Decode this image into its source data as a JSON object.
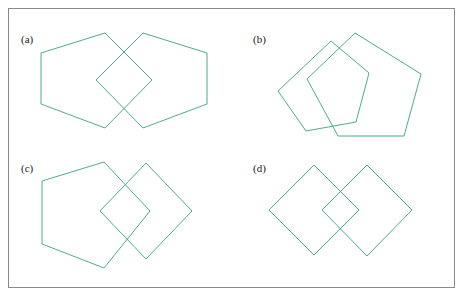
{
  "figure": {
    "width": 465,
    "height": 298,
    "background_color": "#ffffff",
    "frame": {
      "color": "#8a8a8a",
      "x": 8,
      "y": 8,
      "width": 447,
      "height": 280,
      "stroke_width": 1
    },
    "stroke_color": "#3aa37f",
    "stroke_width": 0.9,
    "label_color": "#1a1a1a"
  },
  "panels": [
    {
      "id": "a",
      "label": "(a)",
      "label_x": 21,
      "label_y": 43,
      "description": "Two mirrored pentagons overlapping at their points, forming a central diamond",
      "shapes": [
        {
          "name": "left-pentagon",
          "points": "105,33 41,53 41,104 105,128 152,80"
        },
        {
          "name": "right-pentagon",
          "points": "143,33 207,53 207,104 143,128 96,80"
        }
      ]
    },
    {
      "id": "b",
      "label": "(b)",
      "label_x": 253,
      "label_y": 43,
      "description": "Two rotated pentagons overlapping, one tilted clockwise",
      "shapes": [
        {
          "name": "left-pentagon-rotated",
          "points": "331,41 369,73 356,122 306,131 278,91"
        },
        {
          "name": "right-pentagon",
          "points": "355,33 421,74 404,136 338,136 307,79"
        }
      ]
    },
    {
      "id": "c",
      "label": "(c)",
      "label_x": 21,
      "label_y": 172,
      "description": "A pentagon on the left overlapping a square rotated 45 degrees on the right",
      "shapes": [
        {
          "name": "pentagon",
          "points": "104,162 42,181 42,244 104,268 150,211"
        },
        {
          "name": "diamond-square",
          "points": "146,163 192,211 146,259 100,211"
        }
      ]
    },
    {
      "id": "d",
      "label": "(d)",
      "label_x": 253,
      "label_y": 172,
      "description": "Two squares rotated 45 degrees overlapping side by side",
      "shapes": [
        {
          "name": "left-diamond",
          "points": "314,165 359,210 314,255 269,210"
        },
        {
          "name": "right-diamond",
          "points": "367,165 412,210 367,256 322,210"
        }
      ]
    }
  ]
}
